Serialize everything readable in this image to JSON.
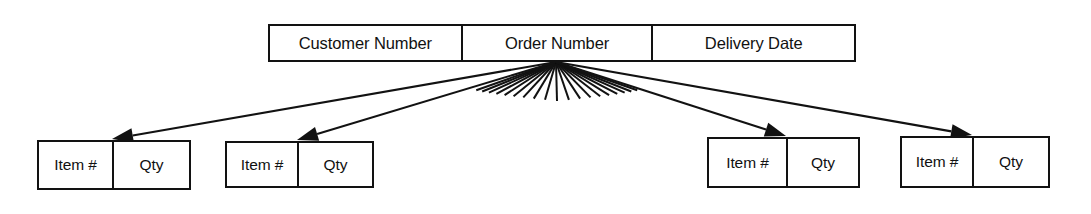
{
  "diagram": {
    "type": "record-structure-diagram",
    "background_color": "#ffffff",
    "stroke_color": "#121212",
    "text_color": "#111111",
    "header_record": {
      "name": "order-header-record",
      "fields": [
        {
          "label": "Customer Number",
          "name": "header-cell-customer"
        },
        {
          "label": "Order Number",
          "name": "header-cell-order"
        },
        {
          "label": "Delivery Date",
          "name": "header-cell-delivery"
        }
      ]
    },
    "line_items": [
      {
        "name": "line-item-1",
        "fields": [
          {
            "label": "Item #",
            "name": "line-item-1-cell-item"
          },
          {
            "label": "Qty",
            "name": "line-item-1-cell-qty"
          }
        ]
      },
      {
        "name": "line-item-2",
        "fields": [
          {
            "label": "Item #",
            "name": "line-item-2-cell-item"
          },
          {
            "label": "Qty",
            "name": "line-item-2-cell-qty"
          }
        ]
      },
      {
        "name": "line-item-3",
        "fields": [
          {
            "label": "Item #",
            "name": "line-item-3-cell-item"
          },
          {
            "label": "Qty",
            "name": "line-item-3-cell-qty"
          }
        ]
      },
      {
        "name": "line-item-4",
        "fields": [
          {
            "label": "Item #",
            "name": "line-item-4-cell-item"
          },
          {
            "label": "Qty",
            "name": "line-item-4-cell-qty"
          }
        ]
      }
    ],
    "connectors": {
      "origin": {
        "x": 556,
        "y": 62
      },
      "arrows": [
        {
          "name": "connector-arrow-to-line-item-1",
          "target_x": 112,
          "target_y": 139
        },
        {
          "name": "connector-arrow-to-line-item-2",
          "target_x": 297,
          "target_y": 140
        },
        {
          "name": "connector-arrow-to-line-item-3",
          "target_x": 786,
          "target_y": 136
        },
        {
          "name": "connector-arrow-to-line-item-4",
          "target_x": 972,
          "target_y": 135
        }
      ],
      "fan_line_count": 19,
      "fan_left_x": 446,
      "fan_right_x": 668,
      "fan_bottom_y": 101
    }
  }
}
